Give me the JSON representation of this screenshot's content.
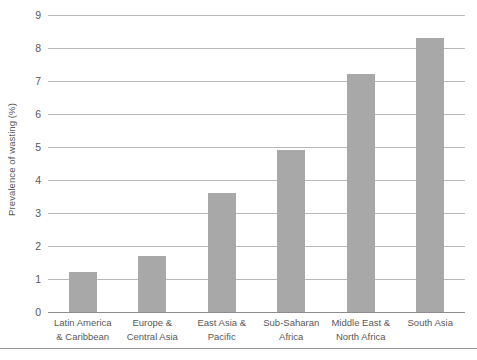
{
  "chart_data": {
    "type": "bar",
    "title": "",
    "xlabel": "",
    "ylabel": "Prevalence of wasting (%)",
    "ylim": [
      0,
      9
    ],
    "ytick_labels": [
      "0",
      "1",
      "2",
      "3",
      "4",
      "5",
      "6",
      "7",
      "8",
      "9"
    ],
    "yticks": [
      0,
      1,
      2,
      3,
      4,
      5,
      6,
      7,
      8,
      9
    ],
    "grid": true,
    "legend": "none",
    "bar_color": "#a8a8a8",
    "gridline_color": "#b9b9bb",
    "categories": [
      "Latin America & Caribbean",
      "Europe & Central Asia",
      "East Asia & Pacific",
      "Sub-Saharan Africa",
      "Middle East & North Africa",
      "South Asia"
    ],
    "category_lines": [
      [
        "Latin America",
        "& Caribbean"
      ],
      [
        "Europe &",
        "Central Asia"
      ],
      [
        "East Asia &",
        "Pacific"
      ],
      [
        "Sub-Saharan",
        "Africa"
      ],
      [
        "Middle East &",
        "North Africa"
      ],
      [
        "South Asia",
        ""
      ]
    ],
    "values": [
      1.2,
      1.7,
      3.6,
      4.9,
      7.2,
      8.3
    ]
  }
}
